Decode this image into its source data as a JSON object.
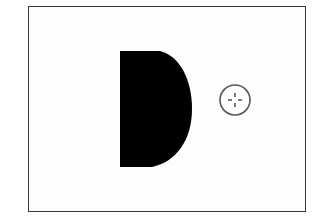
{
  "diagram": {
    "frame": {
      "border_color": "#3a3a3a",
      "background": "#fdfdfd"
    },
    "d_shape": {
      "fill": "#000000",
      "description": "black half-disc (D shape)"
    },
    "target_marker": {
      "stroke": "#555555",
      "icon": "crosshair-icon",
      "description": "small circle with dashed crosshair"
    }
  }
}
